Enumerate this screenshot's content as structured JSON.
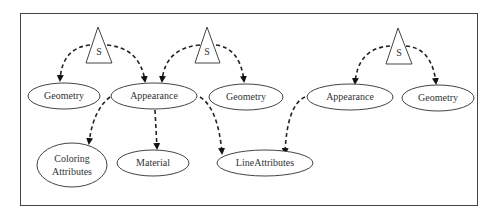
{
  "diagram": {
    "nodes": {
      "s1": {
        "label": "S",
        "shape": "triangle"
      },
      "s2": {
        "label": "S",
        "shape": "triangle"
      },
      "s3": {
        "label": "S",
        "shape": "triangle"
      },
      "geometry1": {
        "label": "Geometry",
        "shape": "ellipse"
      },
      "appearance1": {
        "label": "Appearance",
        "shape": "ellipse"
      },
      "geometry2": {
        "label": "Geometry",
        "shape": "ellipse"
      },
      "appearance2": {
        "label": "Appearance",
        "shape": "ellipse"
      },
      "geometry3": {
        "label": "Geometry",
        "shape": "ellipse"
      },
      "coloring_attributes": {
        "label_line1": "Coloring",
        "label_line2": "Attributes",
        "shape": "ellipse"
      },
      "material": {
        "label": "Material",
        "shape": "ellipse"
      },
      "line_attributes": {
        "label": "LineAttributes",
        "shape": "ellipse"
      }
    },
    "edges": [
      {
        "from": "s1",
        "to": "geometry1",
        "style": "dashed-arrow"
      },
      {
        "from": "s1",
        "to": "appearance1",
        "style": "dashed-arrow"
      },
      {
        "from": "s2",
        "to": "appearance1",
        "style": "dashed-arrow"
      },
      {
        "from": "s2",
        "to": "geometry2",
        "style": "dashed-arrow"
      },
      {
        "from": "s3",
        "to": "appearance2",
        "style": "dashed-arrow"
      },
      {
        "from": "s3",
        "to": "geometry3",
        "style": "dashed-arrow"
      },
      {
        "from": "appearance1",
        "to": "coloring_attributes",
        "style": "dashed-arrow"
      },
      {
        "from": "appearance1",
        "to": "material",
        "style": "dashed-arrow"
      },
      {
        "from": "appearance1",
        "to": "line_attributes",
        "style": "dashed-arrow"
      },
      {
        "from": "appearance2",
        "to": "line_attributes",
        "style": "dashed-arrow"
      }
    ]
  }
}
